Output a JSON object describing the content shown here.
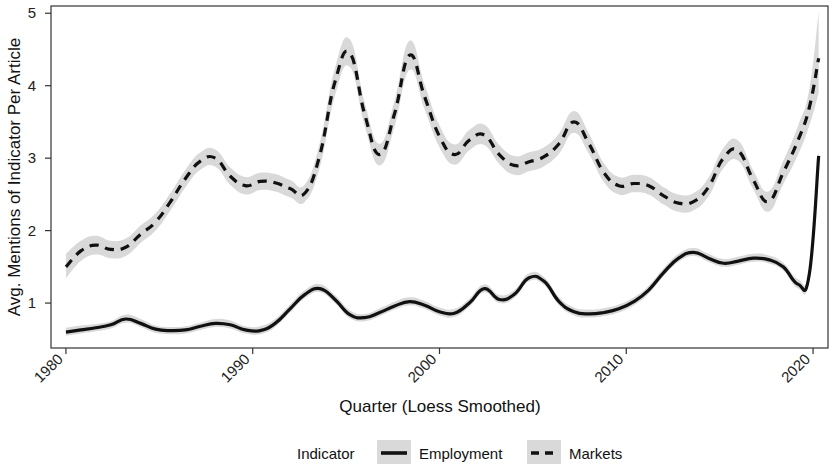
{
  "chart_data": {
    "type": "line",
    "title": "",
    "xlabel": "Quarter (Loess Smoothed)",
    "ylabel": "Avg. Mentions of Indicator Per Article",
    "xlim": [
      1979.2,
      2020.8
    ],
    "ylim": [
      0.38,
      5.1
    ],
    "grid": false,
    "legend_title": "Indicator",
    "legend_position": "bottom",
    "xticks": [
      "1980",
      "1990",
      "2000",
      "2010",
      "2020"
    ],
    "xtick_values": [
      1980,
      1990,
      2000,
      2010,
      2020
    ],
    "yticks": [
      "1",
      "2",
      "3",
      "4",
      "5"
    ],
    "ytick_values": [
      1,
      2,
      3,
      4,
      5
    ],
    "ribbon_color": "#d9d9d9",
    "line_color": "#111111",
    "series": [
      {
        "name": "Employment",
        "style": "solid",
        "x": [
          1980.0,
          1980.8,
          1981.6,
          1982.4,
          1983.2,
          1984.0,
          1984.8,
          1985.6,
          1986.4,
          1987.2,
          1988.0,
          1988.8,
          1989.6,
          1990.4,
          1991.2,
          1992.0,
          1992.8,
          1993.6,
          1994.4,
          1995.2,
          1996.0,
          1996.8,
          1997.6,
          1998.4,
          1999.2,
          2000.0,
          2000.8,
          2001.6,
          2002.4,
          2003.2,
          2004.0,
          2004.8,
          2005.6,
          2006.4,
          2007.2,
          2008.0,
          2008.8,
          2009.6,
          2010.4,
          2011.2,
          2012.0,
          2012.8,
          2013.6,
          2014.4,
          2015.2,
          2016.0,
          2016.8,
          2017.6,
          2018.4,
          2019.2,
          2019.8,
          2020.3
        ],
        "values": [
          0.6,
          0.63,
          0.66,
          0.7,
          0.78,
          0.72,
          0.64,
          0.62,
          0.63,
          0.68,
          0.72,
          0.7,
          0.63,
          0.62,
          0.72,
          0.92,
          1.12,
          1.2,
          1.05,
          0.84,
          0.8,
          0.87,
          0.96,
          1.02,
          0.97,
          0.88,
          0.86,
          1.0,
          1.2,
          1.05,
          1.12,
          1.35,
          1.3,
          1.02,
          0.88,
          0.85,
          0.87,
          0.92,
          1.02,
          1.18,
          1.42,
          1.62,
          1.7,
          1.62,
          1.55,
          1.58,
          1.62,
          1.6,
          1.5,
          1.26,
          1.4,
          3.03
        ],
        "ribbon_lower": [
          0.55,
          0.58,
          0.61,
          0.65,
          0.73,
          0.67,
          0.59,
          0.57,
          0.58,
          0.63,
          0.67,
          0.65,
          0.58,
          0.57,
          0.67,
          0.87,
          1.07,
          1.15,
          1.0,
          0.79,
          0.75,
          0.82,
          0.91,
          0.97,
          0.92,
          0.83,
          0.81,
          0.95,
          1.15,
          1.0,
          1.07,
          1.3,
          1.25,
          0.97,
          0.83,
          0.8,
          0.82,
          0.87,
          0.97,
          1.13,
          1.37,
          1.57,
          1.65,
          1.57,
          1.5,
          1.53,
          1.57,
          1.55,
          1.45,
          1.2,
          1.34,
          2.95
        ],
        "ribbon_upper": [
          0.66,
          0.69,
          0.71,
          0.75,
          0.84,
          0.78,
          0.69,
          0.67,
          0.68,
          0.73,
          0.78,
          0.76,
          0.68,
          0.68,
          0.78,
          0.98,
          1.18,
          1.26,
          1.11,
          0.9,
          0.85,
          0.93,
          1.02,
          1.08,
          1.03,
          0.94,
          0.92,
          1.06,
          1.26,
          1.11,
          1.18,
          1.41,
          1.36,
          1.08,
          0.94,
          0.91,
          0.93,
          0.98,
          1.08,
          1.24,
          1.48,
          1.68,
          1.76,
          1.68,
          1.61,
          1.64,
          1.68,
          1.66,
          1.56,
          1.33,
          1.47,
          3.12
        ]
      },
      {
        "name": "Markets",
        "style": "dashed",
        "x": [
          1980.0,
          1980.8,
          1981.6,
          1982.4,
          1983.2,
          1984.0,
          1984.8,
          1985.6,
          1986.4,
          1987.2,
          1988.0,
          1988.8,
          1989.6,
          1990.4,
          1991.2,
          1992.0,
          1992.8,
          1993.6,
          1994.4,
          1995.2,
          1996.0,
          1996.8,
          1997.6,
          1998.4,
          1999.2,
          2000.0,
          2000.8,
          2001.6,
          2002.4,
          2003.2,
          2004.0,
          2004.8,
          2005.6,
          2006.4,
          2007.2,
          2008.0,
          2008.8,
          2009.6,
          2010.4,
          2011.2,
          2012.0,
          2012.8,
          2013.6,
          2014.4,
          2015.2,
          2016.0,
          2016.8,
          2017.6,
          2018.4,
          2019.2,
          2019.8,
          2020.3
        ],
        "values": [
          1.5,
          1.72,
          1.8,
          1.74,
          1.77,
          1.95,
          2.12,
          2.4,
          2.72,
          2.96,
          3.0,
          2.75,
          2.62,
          2.68,
          2.66,
          2.58,
          2.52,
          3.05,
          4.05,
          4.45,
          3.6,
          3.05,
          3.62,
          4.42,
          3.85,
          3.3,
          3.05,
          3.25,
          3.32,
          3.05,
          2.9,
          2.95,
          3.02,
          3.2,
          3.5,
          3.2,
          2.8,
          2.62,
          2.65,
          2.62,
          2.48,
          2.38,
          2.4,
          2.6,
          3.0,
          3.1,
          2.7,
          2.4,
          2.8,
          3.25,
          3.7,
          4.38
        ],
        "ribbon_lower": [
          1.34,
          1.58,
          1.67,
          1.62,
          1.65,
          1.83,
          2.0,
          2.28,
          2.6,
          2.84,
          2.88,
          2.63,
          2.5,
          2.56,
          2.54,
          2.46,
          2.4,
          2.88,
          3.86,
          4.26,
          3.44,
          2.9,
          3.44,
          4.22,
          3.68,
          3.15,
          2.91,
          3.11,
          3.18,
          2.92,
          2.77,
          2.82,
          2.89,
          3.06,
          3.35,
          3.06,
          2.67,
          2.5,
          2.53,
          2.5,
          2.36,
          2.26,
          2.28,
          2.47,
          2.86,
          2.96,
          2.57,
          2.26,
          2.64,
          3.05,
          3.45,
          3.9
        ],
        "ribbon_upper": [
          1.68,
          1.86,
          1.93,
          1.86,
          1.89,
          2.07,
          2.24,
          2.52,
          2.84,
          3.08,
          3.12,
          2.87,
          2.74,
          2.8,
          2.78,
          2.7,
          2.64,
          3.22,
          4.24,
          4.64,
          3.76,
          3.2,
          3.8,
          4.62,
          4.02,
          3.45,
          3.19,
          3.39,
          3.46,
          3.18,
          3.03,
          3.08,
          3.15,
          3.34,
          3.65,
          3.34,
          2.93,
          2.74,
          2.77,
          2.74,
          2.6,
          2.5,
          2.52,
          2.73,
          3.14,
          3.24,
          2.83,
          2.54,
          2.96,
          3.45,
          3.95,
          5.02
        ]
      }
    ]
  },
  "axes": {
    "y_title": "Avg. Mentions of Indicator Per Article",
    "x_title": "Quarter (Loess Smoothed)"
  },
  "legend": {
    "title": "Indicator",
    "items": [
      {
        "label": "Employment",
        "style": "solid"
      },
      {
        "label": "Markets",
        "style": "dashed"
      }
    ]
  }
}
